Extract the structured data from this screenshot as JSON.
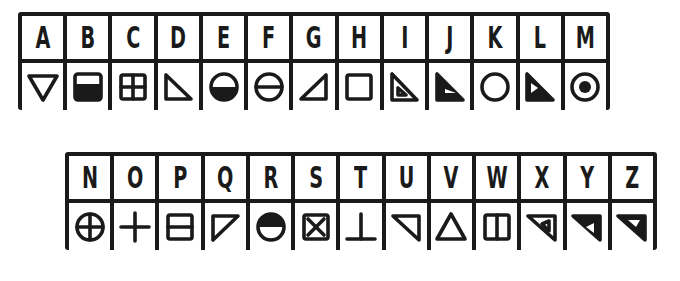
{
  "tables": [
    {
      "name": "top",
      "letters": [
        "A",
        "B",
        "C",
        "D",
        "E",
        "F",
        "G",
        "H",
        "I",
        "J",
        "K",
        "L",
        "M"
      ],
      "symbols": [
        "triangle-down",
        "square-bottom-filled",
        "square-quad",
        "triangle-right-bottom",
        "circle-bottom-filled",
        "circle-horizontal-line",
        "triangle-left-bottom",
        "square",
        "triangle-right-bottom-inner",
        "triangle-right-bottom-filled-inner",
        "circle",
        "triangle-right-bottom-filled-left-notch",
        "circle-dot"
      ]
    },
    {
      "name": "bottom",
      "letters": [
        "N",
        "O",
        "P",
        "Q",
        "R",
        "S",
        "T",
        "U",
        "V",
        "W",
        "X",
        "Y",
        "Z"
      ],
      "symbols": [
        "circle-cross",
        "plus",
        "square-horizontal-line",
        "triangle-top-left",
        "circle-top-filled",
        "square-x",
        "up-tack",
        "triangle-top-right",
        "triangle-up",
        "square-vertical-line",
        "triangle-top-right-inner",
        "triangle-top-right-filled-inner-left",
        "triangle-top-right-filled-inner-top"
      ]
    }
  ],
  "colors": {
    "ink": "#1a1a1a",
    "background": "#ffffff"
  }
}
